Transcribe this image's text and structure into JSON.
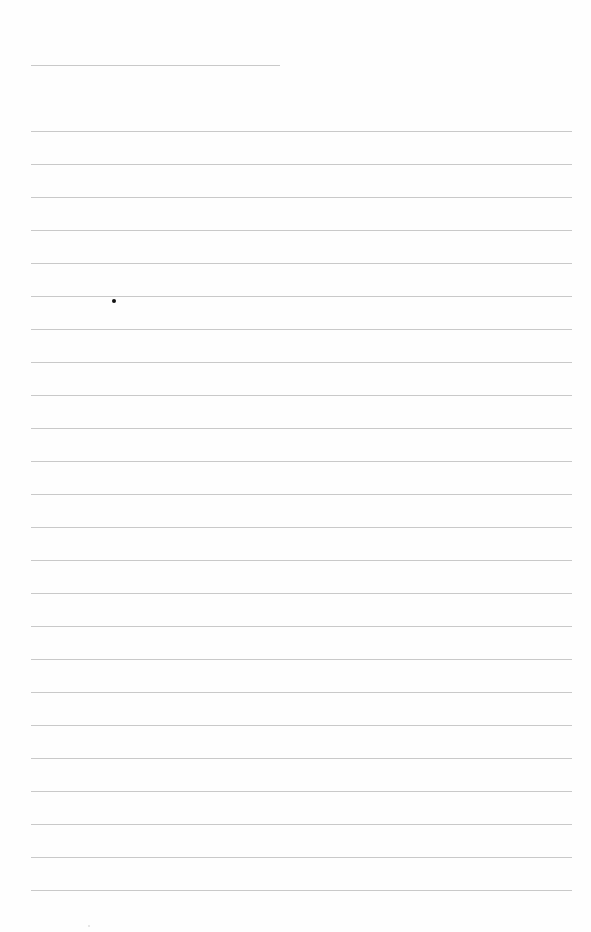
{
  "page": {
    "type": "lined-paper",
    "background": "#fefefe",
    "line_color": "#c9c9c9",
    "header_line": {
      "x": 31,
      "y": 65,
      "width": 249
    },
    "rules": {
      "x": 31,
      "width": 541,
      "first_y": 131,
      "spacing": 33,
      "count": 24
    },
    "marks": [
      {
        "type": "dot",
        "x": 112,
        "y": 299,
        "color": "#111111"
      }
    ],
    "text": []
  }
}
